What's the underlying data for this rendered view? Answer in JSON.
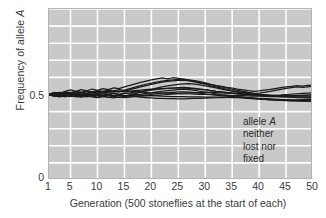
{
  "chart_data": {
    "type": "line",
    "title": "",
    "subtitle": "",
    "xlabel": "Generation (500 stoneflies at the start of each)",
    "ylabel": "Frequency of allele A",
    "ylabel_plain": "Frequency of allele ",
    "ylabel_italic": "A",
    "xlim": [
      1,
      50
    ],
    "ylim": [
      0,
      1
    ],
    "yticks": [
      0,
      0.5
    ],
    "ytick_labels": [
      "0",
      "0.5"
    ],
    "xticks": [
      1,
      5,
      10,
      15,
      20,
      25,
      30,
      35,
      40,
      45,
      50
    ],
    "xtick_labels": [
      "1",
      "5",
      "10",
      "15",
      "20",
      "25",
      "30",
      "35",
      "40",
      "45",
      "50"
    ],
    "grid": true,
    "grid_color": "#ffffff",
    "grid_x_step": 5,
    "grid_y_step": 0.1,
    "plot_background": "#c9c9c9",
    "line_color": "#1a1a1a",
    "legend": "none",
    "annotation": {
      "line1_plain": "allele ",
      "line1_italic": "A",
      "line2": "neither",
      "line3": "lost nor",
      "line4": "fixed"
    },
    "x": [
      1,
      2,
      3,
      4,
      5,
      6,
      7,
      8,
      9,
      10,
      11,
      12,
      13,
      14,
      15,
      16,
      17,
      18,
      19,
      20,
      21,
      22,
      23,
      24,
      25,
      26,
      27,
      28,
      29,
      30,
      31,
      32,
      33,
      34,
      35,
      36,
      37,
      38,
      39,
      40,
      41,
      42,
      43,
      44,
      45,
      46,
      47,
      48,
      49,
      50
    ],
    "series": [
      {
        "name": "population-1",
        "values": [
          0.5,
          0.512,
          0.504,
          0.519,
          0.527,
          0.518,
          0.529,
          0.521,
          0.532,
          0.524,
          0.534,
          0.528,
          0.539,
          0.534,
          0.545,
          0.553,
          0.562,
          0.571,
          0.578,
          0.585,
          0.591,
          0.597,
          0.592,
          0.598,
          0.594,
          0.588,
          0.582,
          0.576,
          0.57,
          0.564,
          0.558,
          0.552,
          0.547,
          0.542,
          0.538,
          0.532,
          0.527,
          0.522,
          0.518,
          0.521,
          0.526,
          0.53,
          0.535,
          0.54,
          0.545,
          0.548,
          0.552,
          0.549,
          0.553,
          0.556
        ]
      },
      {
        "name": "population-2",
        "values": [
          0.5,
          0.494,
          0.505,
          0.497,
          0.508,
          0.5,
          0.511,
          0.504,
          0.514,
          0.508,
          0.518,
          0.512,
          0.521,
          0.516,
          0.525,
          0.534,
          0.543,
          0.552,
          0.56,
          0.567,
          0.573,
          0.578,
          0.582,
          0.585,
          0.588,
          0.59,
          0.586,
          0.581,
          0.575,
          0.568,
          0.56,
          0.552,
          0.545,
          0.538,
          0.531,
          0.524,
          0.518,
          0.512,
          0.507,
          0.502,
          0.498,
          0.494,
          0.491,
          0.488,
          0.486,
          0.484,
          0.482,
          0.481,
          0.48,
          0.48
        ]
      },
      {
        "name": "population-3",
        "values": [
          0.5,
          0.507,
          0.497,
          0.506,
          0.496,
          0.504,
          0.495,
          0.503,
          0.494,
          0.502,
          0.493,
          0.5,
          0.492,
          0.499,
          0.491,
          0.498,
          0.505,
          0.513,
          0.521,
          0.529,
          0.537,
          0.544,
          0.55,
          0.555,
          0.559,
          0.562,
          0.563,
          0.56,
          0.556,
          0.551,
          0.545,
          0.539,
          0.532,
          0.526,
          0.52,
          0.514,
          0.509,
          0.505,
          0.501,
          0.498,
          0.496,
          0.494,
          0.493,
          0.492,
          0.492,
          0.493,
          0.494,
          0.495,
          0.497,
          0.498
        ]
      },
      {
        "name": "population-4",
        "values": [
          0.5,
          0.49,
          0.498,
          0.488,
          0.496,
          0.487,
          0.494,
          0.486,
          0.493,
          0.485,
          0.492,
          0.484,
          0.491,
          0.483,
          0.49,
          0.493,
          0.497,
          0.501,
          0.506,
          0.51,
          0.515,
          0.519,
          0.523,
          0.526,
          0.529,
          0.531,
          0.528,
          0.524,
          0.519,
          0.514,
          0.509,
          0.504,
          0.499,
          0.495,
          0.491,
          0.487,
          0.484,
          0.481,
          0.478,
          0.476,
          0.474,
          0.472,
          0.471,
          0.47,
          0.47,
          0.469,
          0.469,
          0.47,
          0.471,
          0.472
        ]
      },
      {
        "name": "population-5",
        "values": [
          0.5,
          0.496,
          0.491,
          0.487,
          0.493,
          0.488,
          0.484,
          0.49,
          0.486,
          0.482,
          0.488,
          0.484,
          0.48,
          0.486,
          0.482,
          0.485,
          0.489,
          0.493,
          0.497,
          0.501,
          0.505,
          0.508,
          0.511,
          0.513,
          0.515,
          0.516,
          0.514,
          0.511,
          0.508,
          0.504,
          0.5,
          0.497,
          0.493,
          0.49,
          0.487,
          0.484,
          0.481,
          0.478,
          0.476,
          0.473,
          0.471,
          0.469,
          0.467,
          0.466,
          0.464,
          0.463,
          0.462,
          0.461,
          0.461,
          0.46
        ]
      },
      {
        "name": "population-6",
        "values": [
          0.5,
          0.503,
          0.499,
          0.502,
          0.498,
          0.501,
          0.497,
          0.5,
          0.496,
          0.499,
          0.495,
          0.498,
          0.494,
          0.497,
          0.493,
          0.492,
          0.491,
          0.49,
          0.492,
          0.494,
          0.496,
          0.498,
          0.5,
          0.502,
          0.503,
          0.504,
          0.503,
          0.502,
          0.501,
          0.5,
          0.499,
          0.498,
          0.497,
          0.496,
          0.495,
          0.494,
          0.493,
          0.492,
          0.491,
          0.49,
          0.489,
          0.488,
          0.488,
          0.487,
          0.487,
          0.486,
          0.486,
          0.486,
          0.486,
          0.486
        ]
      },
      {
        "name": "population-7",
        "values": [
          0.5,
          0.508,
          0.513,
          0.506,
          0.512,
          0.505,
          0.511,
          0.504,
          0.51,
          0.503,
          0.509,
          0.502,
          0.508,
          0.501,
          0.507,
          0.504,
          0.501,
          0.498,
          0.496,
          0.494,
          0.492,
          0.49,
          0.489,
          0.488,
          0.487,
          0.487,
          0.486,
          0.486,
          0.486,
          0.485,
          0.485,
          0.484,
          0.484,
          0.483,
          0.482,
          0.481,
          0.48,
          0.478,
          0.476,
          0.474,
          0.472,
          0.47,
          0.468,
          0.466,
          0.465,
          0.464,
          0.463,
          0.462,
          0.461,
          0.461
        ]
      },
      {
        "name": "population-8",
        "values": [
          0.5,
          0.492,
          0.486,
          0.494,
          0.488,
          0.495,
          0.489,
          0.496,
          0.49,
          0.497,
          0.491,
          0.498,
          0.492,
          0.499,
          0.493,
          0.49,
          0.487,
          0.484,
          0.482,
          0.48,
          0.478,
          0.477,
          0.476,
          0.476,
          0.475,
          0.475,
          0.476,
          0.477,
          0.478,
          0.479,
          0.48,
          0.481,
          0.482,
          0.483,
          0.484,
          0.484,
          0.483,
          0.482,
          0.48,
          0.478,
          0.476,
          0.474,
          0.472,
          0.47,
          0.468,
          0.467,
          0.466,
          0.465,
          0.464,
          0.463
        ]
      },
      {
        "name": "population-9",
        "values": [
          0.5,
          0.505,
          0.51,
          0.515,
          0.511,
          0.516,
          0.512,
          0.517,
          0.513,
          0.518,
          0.514,
          0.519,
          0.515,
          0.52,
          0.516,
          0.519,
          0.522,
          0.525,
          0.528,
          0.531,
          0.533,
          0.535,
          0.536,
          0.537,
          0.538,
          0.538,
          0.536,
          0.533,
          0.53,
          0.527,
          0.523,
          0.519,
          0.516,
          0.512,
          0.509,
          0.506,
          0.503,
          0.501,
          0.499,
          0.497,
          0.496,
          0.495,
          0.494,
          0.494,
          0.494,
          0.494,
          0.495,
          0.496,
          0.497,
          0.498
        ]
      },
      {
        "name": "population-10",
        "values": [
          0.5,
          0.497,
          0.503,
          0.5,
          0.506,
          0.503,
          0.509,
          0.506,
          0.512,
          0.509,
          0.515,
          0.512,
          0.518,
          0.515,
          0.521,
          0.528,
          0.536,
          0.544,
          0.552,
          0.559,
          0.566,
          0.572,
          0.577,
          0.58,
          0.583,
          0.584,
          0.58,
          0.574,
          0.567,
          0.56,
          0.552,
          0.544,
          0.537,
          0.53,
          0.523,
          0.517,
          0.512,
          0.508,
          0.505,
          0.508,
          0.513,
          0.518,
          0.524,
          0.53,
          0.536,
          0.54,
          0.544,
          0.541,
          0.545,
          0.548
        ]
      },
      {
        "name": "population-11",
        "values": [
          0.5,
          0.511,
          0.506,
          0.514,
          0.509,
          0.517,
          0.512,
          0.52,
          0.515,
          0.523,
          0.518,
          0.526,
          0.521,
          0.528,
          0.523,
          0.52,
          0.517,
          0.514,
          0.512,
          0.51,
          0.509,
          0.508,
          0.508,
          0.507,
          0.507,
          0.508,
          0.509,
          0.51,
          0.511,
          0.512,
          0.512,
          0.511,
          0.51,
          0.508,
          0.506,
          0.504,
          0.502,
          0.5,
          0.498,
          0.497,
          0.496,
          0.496,
          0.497,
          0.498,
          0.5,
          0.502,
          0.504,
          0.506,
          0.508,
          0.51
        ]
      },
      {
        "name": "population-12",
        "values": [
          0.5,
          0.489,
          0.495,
          0.49,
          0.497,
          0.492,
          0.499,
          0.494,
          0.501,
          0.496,
          0.503,
          0.498,
          0.505,
          0.5,
          0.507,
          0.51,
          0.514,
          0.518,
          0.522,
          0.526,
          0.53,
          0.533,
          0.536,
          0.538,
          0.54,
          0.541,
          0.539,
          0.536,
          0.532,
          0.528,
          0.523,
          0.518,
          0.514,
          0.51,
          0.506,
          0.503,
          0.5,
          0.498,
          0.496,
          0.494,
          0.492,
          0.49,
          0.489,
          0.488,
          0.487,
          0.486,
          0.485,
          0.485,
          0.484,
          0.484
        ]
      }
    ]
  }
}
